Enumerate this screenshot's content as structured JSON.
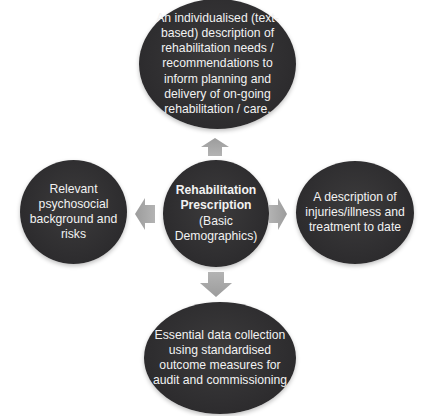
{
  "diagram": {
    "center": {
      "title_line1": "Rehabilitation",
      "title_line2": "Prescription",
      "subtitle": "(Basic Demographics)"
    },
    "top": {
      "text": "An individualised (text-based) description of rehabilitation needs / recommendations to inform planning and delivery of on-going rehabilitation / care."
    },
    "left": {
      "text": "Relevant psychosocial background and risks"
    },
    "right": {
      "text": "A description of injuries/illness and treatment to date"
    },
    "bottom": {
      "text": "Essential data collection using standardised outcome measures for audit and commissioning"
    },
    "arrows": [
      "up",
      "left",
      "right",
      "down"
    ],
    "colors": {
      "node_fill": "#2f2e30",
      "node_text": "#f2f2f2",
      "arrow_fill": "#a6a6a6",
      "background": "#ffffff"
    }
  }
}
